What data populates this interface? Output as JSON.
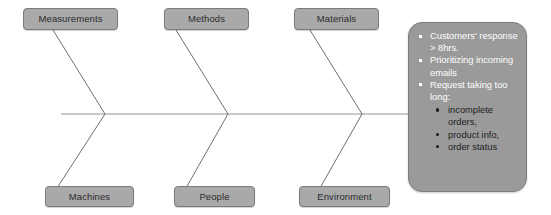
{
  "diagram": {
    "type": "fishbone-ishikawa",
    "causes_top": [
      {
        "label": "Measurements"
      },
      {
        "label": "Methods"
      },
      {
        "label": "Materials"
      }
    ],
    "causes_bottom": [
      {
        "label": "Machines"
      },
      {
        "label": "People"
      },
      {
        "label": "Environment"
      }
    ],
    "effect_panel": {
      "bullets": [
        {
          "text": "Customers' response > 8hrs.",
          "sub": []
        },
        {
          "text": "Prioritizing incoming emails",
          "sub": []
        },
        {
          "text": "Request taking too long:",
          "sub": [
            {
              "text": "incomplete orders,"
            },
            {
              "text": "product info,"
            },
            {
              "text": "order status"
            }
          ]
        }
      ]
    },
    "colors": {
      "box_fill": "#a9a9a9",
      "box_border": "#7a7a7a",
      "box_text": "#2b2b2b",
      "panel_fill": "#9a9a9a",
      "panel_border": "#7d7d7d",
      "panel_text": "#ffffff",
      "panel_subtext": "#1d1d1d",
      "spine": "#c9c9c9",
      "bone": "#6f6f6f",
      "background": "#ffffff"
    }
  }
}
